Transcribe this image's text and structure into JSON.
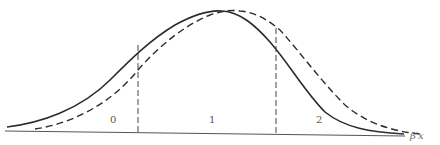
{
  "diagram": {
    "type": "ordered-probit-density-thresholds",
    "axis_label": "β′x",
    "region_labels": [
      "0",
      "1",
      "2"
    ],
    "curves": [
      {
        "name": "solid-density-curve",
        "style": "solid",
        "peak_x": 222
      },
      {
        "name": "dashed-density-curve",
        "style": "dashed",
        "peak_x": 238
      }
    ],
    "thresholds": [
      {
        "name": "threshold-left",
        "x": 138
      },
      {
        "name": "threshold-right",
        "x": 276
      }
    ],
    "colors": {
      "line": "#2b2b2b",
      "text": "#555555"
    }
  }
}
